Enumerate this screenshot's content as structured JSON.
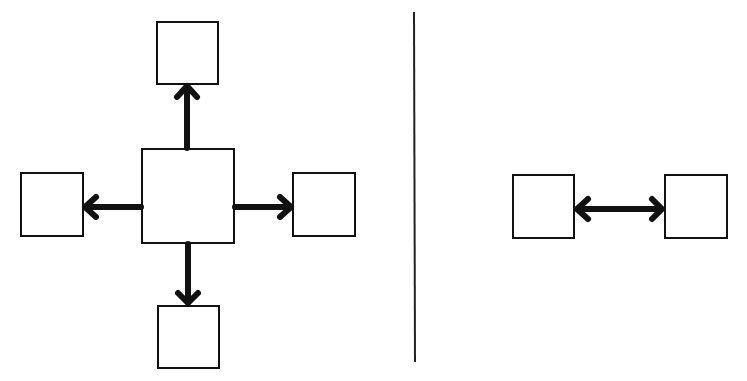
{
  "diagram": {
    "colors": {
      "stroke": "#111111",
      "fill": "#ffffff",
      "background": "#ffffff"
    },
    "left_panel": {
      "type": "hub-and-spoke",
      "hub": {
        "x": 142,
        "y": 149,
        "w": 92,
        "h": 94
      },
      "nodes": [
        {
          "id": "top",
          "x": 157,
          "y": 22,
          "w": 61,
          "h": 62
        },
        {
          "id": "left",
          "x": 21,
          "y": 173,
          "w": 62,
          "h": 63
        },
        {
          "id": "right",
          "x": 293,
          "y": 173,
          "w": 62,
          "h": 63
        },
        {
          "id": "bottom",
          "x": 158,
          "y": 306,
          "w": 61,
          "h": 62
        }
      ],
      "arrows": [
        {
          "from": "hub",
          "to": "top",
          "direction": "one-way"
        },
        {
          "from": "hub",
          "to": "left",
          "direction": "one-way"
        },
        {
          "from": "hub",
          "to": "right",
          "direction": "one-way"
        },
        {
          "from": "hub",
          "to": "bottom",
          "direction": "one-way"
        }
      ]
    },
    "divider": {
      "x": 414,
      "y1": 12,
      "y2": 362
    },
    "right_panel": {
      "type": "peer-to-peer",
      "nodes": [
        {
          "id": "a",
          "x": 513,
          "y": 175,
          "w": 61,
          "h": 63
        },
        {
          "id": "b",
          "x": 665,
          "y": 175,
          "w": 62,
          "h": 63
        }
      ],
      "arrows": [
        {
          "from": "a",
          "to": "b",
          "direction": "two-way"
        }
      ]
    }
  }
}
